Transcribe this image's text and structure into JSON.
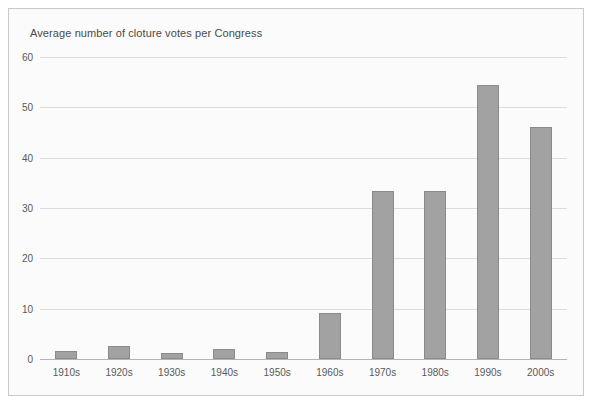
{
  "figure": {
    "title": "Average number of cloture votes per Congress",
    "background_color": "#fbfbfb",
    "border_color": "#c9c9c9"
  },
  "chart_data": {
    "type": "bar",
    "title": "Average number of cloture votes per Congress",
    "xlabel": "",
    "ylabel": "",
    "ylim": [
      0,
      60
    ],
    "yticks": [
      0,
      10,
      20,
      30,
      40,
      50,
      60
    ],
    "ytick_labels": [
      "0",
      "10",
      "20",
      "30",
      "40",
      "50",
      "60"
    ],
    "grid": true,
    "legend": false,
    "bar_color": "#a2a2a2",
    "bar_border_color": "#8a8a8a",
    "categories": [
      "1910s",
      "1920s",
      "1930s",
      "1940s",
      "1950s",
      "1960s",
      "1970s",
      "1980s",
      "1990s",
      "2000s"
    ],
    "values": [
      1.6,
      2.6,
      1.1,
      1.9,
      1.3,
      9.2,
      33.4,
      33.4,
      54.4,
      46.0
    ]
  }
}
